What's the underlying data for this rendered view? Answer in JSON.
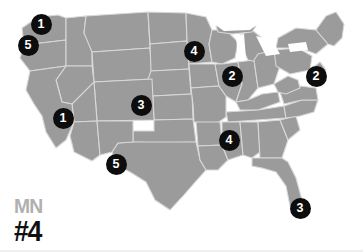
{
  "canvas": {
    "width": 363,
    "height": 252,
    "background_color": "#ffffff"
  },
  "map": {
    "name": "united-states-map",
    "land_color": "#9b9b9b",
    "border_color": "#d8d8d8",
    "lake_color": "#ffffff"
  },
  "legend": {
    "state_abbr": "MN",
    "rank": "#4",
    "abbr_color": "#b0b0b0",
    "rank_color": "#111111"
  },
  "markers": {
    "shape": "circle",
    "fill_color": "#0d0d0d",
    "text_color": "#ffffff",
    "items": [
      {
        "label": "1",
        "x": 41,
        "y": 24,
        "region": "washington"
      },
      {
        "label": "5",
        "x": 28,
        "y": 45,
        "region": "oregon-washington-coast"
      },
      {
        "label": "4",
        "x": 194,
        "y": 51,
        "region": "minnesota"
      },
      {
        "label": "2",
        "x": 232,
        "y": 76,
        "region": "illinois-indiana"
      },
      {
        "label": "2",
        "x": 316,
        "y": 76,
        "region": "new-york-new-jersey"
      },
      {
        "label": "3",
        "x": 141,
        "y": 105,
        "region": "nebraska-kansas"
      },
      {
        "label": "1",
        "x": 63,
        "y": 118,
        "region": "nevada-california"
      },
      {
        "label": "4",
        "x": 229,
        "y": 140,
        "region": "tennessee-mississippi"
      },
      {
        "label": "5",
        "x": 116,
        "y": 164,
        "region": "texas-new-mexico"
      },
      {
        "label": "3",
        "x": 300,
        "y": 208,
        "region": "florida"
      }
    ]
  }
}
